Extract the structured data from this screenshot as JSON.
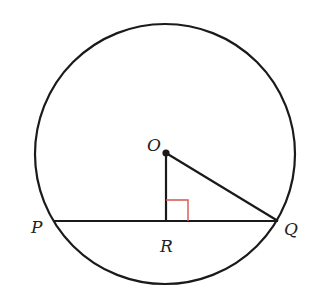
{
  "diagram": {
    "type": "geometry",
    "colors": {
      "stroke": "#1a1a1a",
      "right_angle_marker": "#d9534f",
      "background": "#ffffff"
    },
    "circle": {
      "center": "O",
      "cx": 165,
      "cy": 154,
      "r": 130
    },
    "points": [
      {
        "name": "O",
        "label": "O",
        "x": 166,
        "y": 153,
        "label_x": 147,
        "label_y": 151
      },
      {
        "name": "P",
        "label": "P",
        "x": 54,
        "y": 221,
        "label_x": 31,
        "label_y": 233
      },
      {
        "name": "R",
        "label": "R",
        "x": 166,
        "y": 221,
        "label_x": 160,
        "label_y": 252
      },
      {
        "name": "Q",
        "label": "Q",
        "x": 278,
        "y": 221,
        "label_x": 284,
        "label_y": 235
      }
    ],
    "segments": [
      {
        "from": "P",
        "to": "Q",
        "role": "chord"
      },
      {
        "from": "O",
        "to": "R",
        "role": "perpendicular"
      },
      {
        "from": "O",
        "to": "Q",
        "role": "radius"
      }
    ],
    "right_angle": {
      "at": "R",
      "size": 22
    }
  }
}
